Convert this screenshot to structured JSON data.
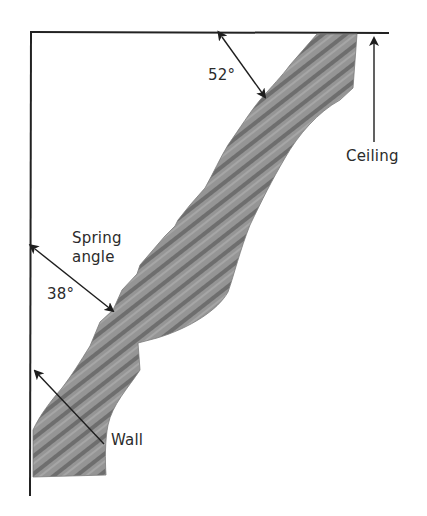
{
  "diagram": {
    "colors": {
      "line": "#222222",
      "molding_fill": "#8f8f8f",
      "molding_band": "#6a6a6a",
      "molding_light": "#a8a8a8",
      "text": "#2b2b2b",
      "background": "#ffffff"
    },
    "labels": {
      "top_angle": "52°",
      "ceiling": "Ceiling",
      "spring_line1": "Spring",
      "spring_line2": "angle",
      "bottom_angle": "38°",
      "wall": "Wall"
    },
    "surfaces": [
      {
        "name": "ceiling",
        "orientation": "horizontal"
      },
      {
        "name": "wall",
        "orientation": "vertical"
      }
    ],
    "angles": [
      {
        "label": "52°",
        "between": "molding back and ceiling"
      },
      {
        "label": "38°",
        "between": "molding back and wall",
        "name": "Spring angle"
      }
    ]
  }
}
